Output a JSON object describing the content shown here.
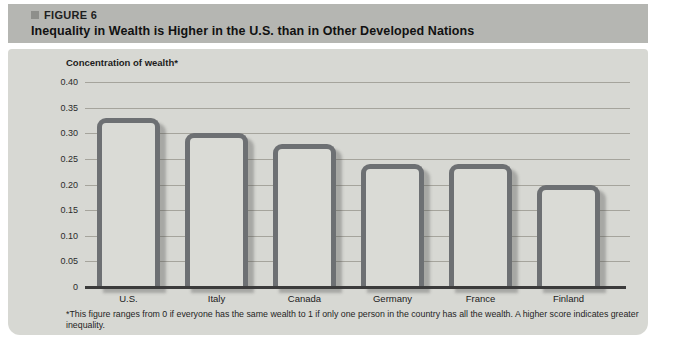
{
  "figure": {
    "label": "FIGURE 6",
    "title": "Inequality in Wealth is Higher in the U.S. than in Other Developed Nations",
    "footnote": "*This figure ranges from 0 if everyone has the same wealth to 1 if only one person in the country has all the wealth. A higher score indicates greater inequality."
  },
  "chart_data": {
    "type": "bar",
    "title": "Inequality in Wealth is Higher in the U.S. than in Other Developed Nations",
    "ylabel": "Concentration of wealth*",
    "xlabel": "",
    "categories": [
      "U.S.",
      "Italy",
      "Canada",
      "Germany",
      "France",
      "Finland"
    ],
    "values": [
      0.33,
      0.3,
      0.28,
      0.24,
      0.24,
      0.2
    ],
    "ylim": [
      0,
      0.4
    ],
    "ytick_labels": [
      "0.40",
      "0.35",
      "0.30",
      "0.25",
      "0.20",
      "0.15",
      "0.10",
      "0.05",
      "0"
    ],
    "ytick_values": [
      0.4,
      0.35,
      0.3,
      0.25,
      0.2,
      0.15,
      0.1,
      0.05,
      0
    ],
    "grid": "horizontal",
    "legend": "none"
  },
  "colors": {
    "header_band": "#b5b6b2",
    "panel_background": "#d7d8d3",
    "gridline": "#a5a49c",
    "axis_line": "#3b3b3b",
    "bar_fill": "#dadbd6",
    "bar_border": "#6d7073"
  }
}
